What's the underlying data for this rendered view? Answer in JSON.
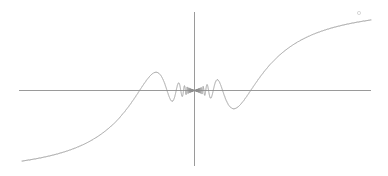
{
  "figure": {
    "title": "",
    "background_color": "#ffffff",
    "width": 388,
    "height": 176
  },
  "style": {
    "curve_color": "#8d8d8d",
    "axis_color": "#9a9a9a",
    "marker_color": "#c8c8c8",
    "curve_width": 0.8,
    "axis_width": 1
  },
  "axes": {
    "x_axis": {
      "name": "x-axis",
      "pixel_y": 90,
      "pixel_x_start": 19,
      "pixel_x_end": 371,
      "visible": true,
      "ticks": [],
      "tick_labels": [],
      "label": ""
    },
    "y_axis": {
      "name": "y-axis",
      "pixel_x": 194,
      "pixel_y_start": 12,
      "pixel_y_end": 166,
      "visible": true,
      "ticks": [],
      "tick_labels": [],
      "label": ""
    },
    "grid": false,
    "frame": false,
    "legend": null
  },
  "chart_data": {
    "type": "line",
    "title": "",
    "subtitle": "",
    "xlabel": "",
    "ylabel": "",
    "xlim": [
      -1.0,
      1.0
    ],
    "ylim": [
      -0.45,
      0.45
    ],
    "grid": false,
    "legend_position": "none",
    "series": [
      {
        "name": "x*sin(1/x)",
        "expression": "y = x * sin(1/x)",
        "symmetry": "odd",
        "color": "#8d8d8d",
        "n_samples": 4000,
        "domain": [
          -1.0,
          1.0
        ],
        "singular_point": 0.0,
        "envelope": "|x|",
        "description": "Amplitude grows linearly with |x| while oscillation frequency diverges toward x = 0; curve is antisymmetric about the origin.",
        "x": [
          -1.0,
          -0.95,
          -0.9,
          -0.85,
          -0.8,
          -0.75,
          -0.7,
          -0.65,
          -0.6,
          -0.55,
          -0.5,
          -0.45,
          -0.4,
          -0.35,
          -0.3,
          -0.25,
          -0.2,
          -0.15,
          -0.1,
          -0.05,
          0.0,
          0.05,
          0.1,
          0.15,
          0.2,
          0.25,
          0.3,
          0.35,
          0.4,
          0.45,
          0.5,
          0.55,
          0.6,
          0.65,
          0.7,
          0.75,
          0.8,
          0.85,
          0.9,
          0.95,
          1.0
        ],
        "y": [
          -0.841,
          -0.817,
          -0.783,
          -0.736,
          -0.672,
          -0.586,
          -0.474,
          -0.331,
          -0.156,
          0.045,
          0.249,
          0.417,
          0.495,
          0.442,
          0.279,
          0.075,
          -0.079,
          -0.039,
          0.054,
          0.046,
          0.0,
          -0.046,
          -0.054,
          0.039,
          0.079,
          -0.075,
          -0.279,
          -0.442,
          -0.495,
          -0.417,
          -0.249,
          -0.045,
          0.156,
          0.331,
          0.474,
          0.586,
          0.672,
          0.736,
          0.783,
          0.817,
          0.841
        ],
        "extrema_pixels": {
          "left_min": [
            24,
            165
          ],
          "left_max": [
            45,
            34
          ],
          "right_min": [
            345,
            146
          ],
          "right_max": [
            368,
            20
          ]
        },
        "visible_extrema_left": [
          {
            "pixel": [
              24,
              165
            ],
            "kind": "minimum"
          },
          {
            "pixel": [
              45,
              34
            ],
            "kind": "maximum"
          },
          {
            "pixel": [
              66,
              132
            ],
            "kind": "minimum"
          },
          {
            "pixel": [
              82,
              46
            ],
            "kind": "maximum"
          },
          {
            "pixel": [
              96,
              120
            ],
            "kind": "minimum"
          },
          {
            "pixel": [
              107,
              55
            ],
            "kind": "maximum"
          },
          {
            "pixel": [
              117,
              112
            ],
            "kind": "minimum"
          },
          {
            "pixel": [
              125,
              62
            ],
            "kind": "maximum"
          },
          {
            "pixel": [
              133,
              107
            ],
            "kind": "minimum"
          },
          {
            "pixel": [
              140,
              67
            ],
            "kind": "maximum"
          },
          {
            "pixel": [
              146,
              104
            ],
            "kind": "minimum"
          },
          {
            "pixel": [
              152,
              71
            ],
            "kind": "maximum"
          },
          {
            "pixel": [
              157,
              101
            ],
            "kind": "minimum"
          },
          {
            "pixel": [
              162,
              74
            ],
            "kind": "maximum"
          }
        ],
        "visible_extrema_right": [
          {
            "pixel": [
              226,
              106
            ],
            "kind": "minimum"
          },
          {
            "pixel": [
              232,
              76
            ],
            "kind": "maximum"
          },
          {
            "pixel": [
              238,
              108
            ],
            "kind": "minimum"
          },
          {
            "pixel": [
              245,
              72
            ],
            "kind": "maximum"
          },
          {
            "pixel": [
              252,
              111
            ],
            "kind": "minimum"
          },
          {
            "pixel": [
              261,
              67
            ],
            "kind": "maximum"
          },
          {
            "pixel": [
              270,
              116
            ],
            "kind": "minimum"
          },
          {
            "pixel": [
              281,
              61
            ],
            "kind": "maximum"
          },
          {
            "pixel": [
              292,
              124
            ],
            "kind": "minimum"
          },
          {
            "pixel": [
              306,
              50
            ],
            "kind": "maximum"
          },
          {
            "pixel": [
              322,
              137
            ],
            "kind": "minimum"
          },
          {
            "pixel": [
              345,
              146
            ],
            "kind": "minimum"
          },
          {
            "pixel": [
              368,
              20
            ],
            "kind": "maximum"
          }
        ]
      }
    ],
    "annotations": [
      {
        "name": "endpoint-marker",
        "pixel": [
          359,
          13
        ],
        "radius": 1.6,
        "text": "",
        "color": "#c8c8c8"
      }
    ]
  }
}
